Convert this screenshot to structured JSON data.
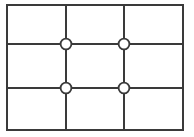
{
  "canvas": {
    "width": 194,
    "height": 137,
    "background_color": "#ffffff"
  },
  "diagram": {
    "stroke_color": "#3a3a3a",
    "node_fill_color": "#ffffff",
    "node_stroke_color": "#3a3a3a",
    "outer_stroke_width": 2.6,
    "inner_stroke_width": 2.0,
    "node_stroke_width": 1.8,
    "node_radius": 5.4,
    "rows": 3,
    "columns": 3,
    "frame": {
      "x1": 7,
      "y1": 5,
      "x2": 183,
      "y2": 130
    },
    "vertical_lines": [
      {
        "label": "vertical-line-1",
        "x": 66,
        "y1": 5,
        "y2": 130
      },
      {
        "label": "vertical-line-2",
        "x": 124,
        "y1": 5,
        "y2": 130
      }
    ],
    "horizontal_lines": [
      {
        "label": "horizontal-line-1",
        "y": 44,
        "x1": 7,
        "x2": 183
      },
      {
        "label": "horizontal-line-2",
        "y": 88,
        "x1": 7,
        "x2": 183
      }
    ],
    "nodes": [
      {
        "label": "node-top-left",
        "cx": 66,
        "cy": 44
      },
      {
        "label": "node-top-right",
        "cx": 124,
        "cy": 44
      },
      {
        "label": "node-bottom-left",
        "cx": 66,
        "cy": 88
      },
      {
        "label": "node-bottom-right",
        "cx": 124,
        "cy": 88
      }
    ]
  }
}
